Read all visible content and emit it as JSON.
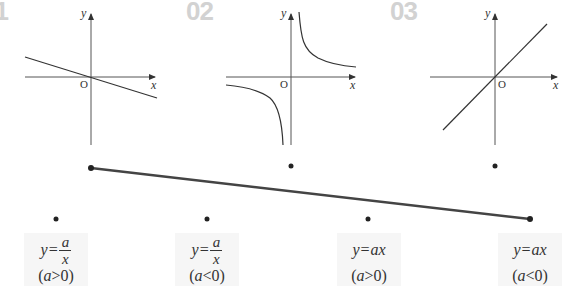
{
  "panels": [
    {
      "number": "01",
      "graph": "line-decreasing",
      "axis_x": "x",
      "axis_y": "y",
      "origin": "O"
    },
    {
      "number": "02",
      "graph": "hyperbola-quadrants-1-3",
      "axis_x": "x",
      "axis_y": "y",
      "origin": "O"
    },
    {
      "number": "03",
      "graph": "line-increasing",
      "axis_x": "x",
      "axis_y": "y",
      "origin": "O"
    }
  ],
  "options": [
    {
      "lhs": "y=",
      "numerator": "a",
      "denominator": "x",
      "cond_var": "a",
      "cond_op": ">",
      "cond_val": "0)",
      "cond_open": "("
    },
    {
      "lhs": "y=",
      "numerator": "a",
      "denominator": "x",
      "cond_var": "a",
      "cond_op": "<",
      "cond_val": "0)",
      "cond_open": "("
    },
    {
      "lhs": "y=ax",
      "cond_var": "a",
      "cond_op": ">",
      "cond_val": "0)",
      "cond_open": "("
    },
    {
      "lhs": "y=ax",
      "cond_var": "a",
      "cond_op": "<",
      "cond_val": "0)",
      "cond_open": "("
    }
  ],
  "connection": {
    "from": "panel-01",
    "to": "option-4",
    "color": "#444444"
  },
  "colors": {
    "number": "#d2d2d2",
    "axis": "#333333",
    "label_bg": "#f6f6f6",
    "dot": "#222222"
  }
}
